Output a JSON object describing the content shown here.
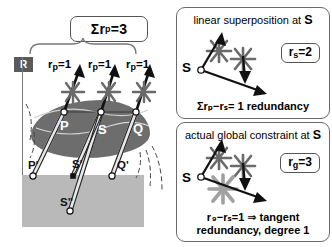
{
  "figure": {
    "left_panel": {
      "sum_box_label": "Σr",
      "sum_box_sub": "p",
      "sum_box_value": "=3",
      "region_badge": "R",
      "rp_labels": [
        {
          "main": "r",
          "sub": "p",
          "value": "=1"
        },
        {
          "main": "r",
          "sub": "p",
          "value": "=1"
        },
        {
          "main": "r",
          "sub": "p",
          "value": "=1"
        }
      ],
      "blob_points": [
        "P",
        "S",
        "Q"
      ],
      "projected_points": [
        "P'",
        "S'",
        "Q'",
        "S\""
      ]
    },
    "panel_top": {
      "title_text": "linear superposition at ",
      "title_symbol": "S",
      "badge_main": "r",
      "badge_sub": "s",
      "badge_value": "=2",
      "origin_label": "S",
      "footer": "Σrₚ−rₛ= 1 redundancy"
    },
    "panel_bottom": {
      "title_text": "actual global constraint at ",
      "title_symbol": "S",
      "badge_main": "r",
      "badge_sub": "g",
      "badge_value": "=3",
      "origin_label": "S",
      "footer_line1": "r ₉−rₛ=1 ⇒ tangent",
      "footer_line2": "redundancy, degree 1"
    },
    "colors": {
      "blob_fill": "#6d6d6d",
      "ground_fill": "#b9b9b9",
      "badge_fill": "#5a5a5a",
      "stroke": "#6a6a6a",
      "burst_dark": "#5e5e5e",
      "burst_light": "#9c9c9c"
    }
  }
}
